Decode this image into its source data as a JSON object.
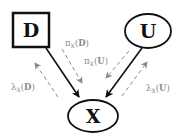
{
  "diagram": {
    "type": "bayesian-network-message-passing",
    "nodes": [
      {
        "id": "D",
        "label": "D",
        "shape": "square"
      },
      {
        "id": "U",
        "label": "U",
        "shape": "ellipse"
      },
      {
        "id": "X",
        "label": "X",
        "shape": "ellipse"
      }
    ],
    "edges": [
      {
        "from": "D",
        "to": "X",
        "style": "solid"
      },
      {
        "from": "U",
        "to": "X",
        "style": "solid"
      }
    ],
    "messages": [
      {
        "id": "pi_X_D",
        "func": "π",
        "sub": "X",
        "arg": "D",
        "direction": "D→X"
      },
      {
        "id": "pi_X_U",
        "func": "π",
        "sub": "X",
        "arg": "U",
        "direction": "U→X"
      },
      {
        "id": "lambda_X_D",
        "func": "λ",
        "sub": "X",
        "arg": "D",
        "direction": "X→D"
      },
      {
        "id": "lambda_X_U",
        "func": "λ",
        "sub": "X",
        "arg": "U",
        "direction": "X→U"
      }
    ],
    "colors": {
      "solid": "#111111",
      "dashed": "#8a8a8a"
    }
  },
  "labels": {
    "D": "D",
    "U": "U",
    "X": "X",
    "pi": "π",
    "lambda": "λ",
    "X_sub": "X",
    "open": "(",
    "close": ")",
    "argD": "D",
    "argU": "U"
  }
}
